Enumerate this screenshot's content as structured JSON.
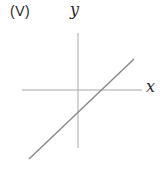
{
  "figure": {
    "option_label": "(V)",
    "x_axis_label": "x",
    "y_axis_label": "y",
    "lines": [
      {
        "name": "x-axis",
        "x1": 22,
        "y1": 90,
        "x2": 142,
        "y2": 90,
        "color": "#a8a8a8",
        "width": 1
      },
      {
        "name": "y-axis",
        "x1": 78,
        "y1": 33,
        "x2": 78,
        "y2": 148,
        "color": "#a8a8a8",
        "width": 1
      },
      {
        "name": "plotted-line",
        "x1": 29,
        "y1": 159,
        "x2": 134,
        "y2": 59,
        "color": "#878787",
        "width": 1.4
      }
    ]
  },
  "colors": {
    "background": "#ffffff",
    "axis": "#a8a8a8",
    "plotted_line": "#878787",
    "text": "#1f1f1f"
  }
}
